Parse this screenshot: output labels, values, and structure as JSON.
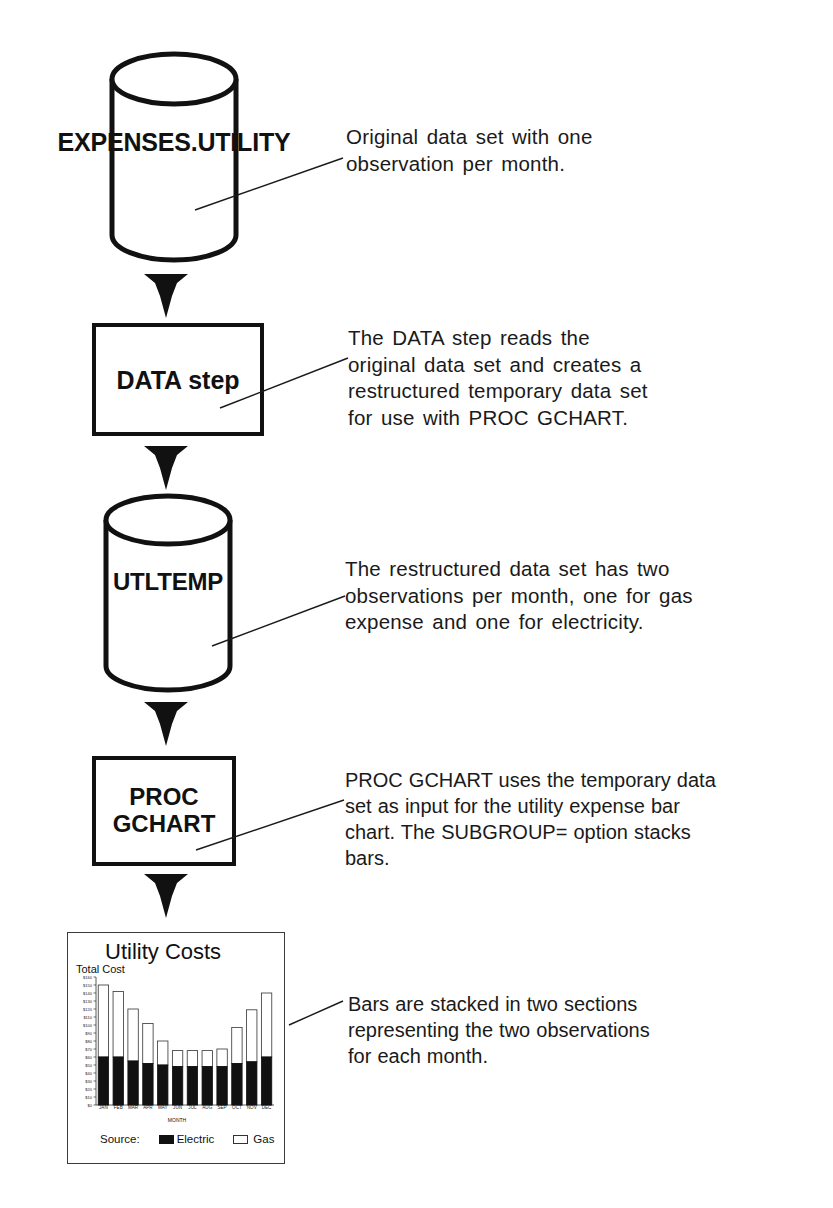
{
  "diagram": {
    "nodes": [
      {
        "id": "expenses-utility",
        "type": "dataset",
        "label": "EXPENSES.UTILITY"
      },
      {
        "id": "data-step",
        "type": "process",
        "label": "DATA step"
      },
      {
        "id": "utltemp",
        "type": "dataset",
        "label": "UTLTEMP"
      },
      {
        "id": "proc-gchart",
        "type": "process",
        "label": "PROC\nGCHART"
      },
      {
        "id": "output-chart",
        "type": "output",
        "label": "Utility Costs"
      }
    ],
    "annotations": [
      {
        "id": "annot-expenses",
        "text": "Original data set with one\nobservation per month."
      },
      {
        "id": "annot-data-step",
        "text": "The DATA step reads the\noriginal data set and creates a\nrestructured temporary data set\nfor use with PROC GCHART."
      },
      {
        "id": "annot-utltemp",
        "text": "The restructured data set has two\nobservations per month, one for gas\nexpense and one for electricity."
      },
      {
        "id": "annot-gchart",
        "text": "PROC GCHART uses the temporary data\nset as input for the utility expense bar\nchart. The SUBGROUP= option stacks\nbars."
      },
      {
        "id": "annot-output",
        "text": "Bars are stacked in two sections\nrepresenting the two observations\nfor each month."
      }
    ]
  },
  "chart_data": {
    "type": "bar",
    "subtype": "stacked-vertical",
    "title": "Utility Costs",
    "xlabel": "MONTH",
    "ylabel": "Total Cost",
    "categories": [
      "JAN",
      "FEB",
      "MAR",
      "APR",
      "MAY",
      "JUN",
      "JUL",
      "AUG",
      "SEP",
      "OCT",
      "NOV",
      "DEC"
    ],
    "series": [
      {
        "name": "Electric",
        "color": "#111111",
        "values": [
          60,
          60,
          55,
          52,
          50,
          48,
          48,
          48,
          48,
          52,
          54,
          60
        ]
      },
      {
        "name": "Gas",
        "color": "#ffffff",
        "values": [
          90,
          82,
          65,
          50,
          30,
          20,
          20,
          20,
          22,
          45,
          65,
          80
        ]
      }
    ],
    "totals": [
      150,
      142,
      120,
      102,
      80,
      68,
      68,
      68,
      70,
      97,
      119,
      140
    ],
    "ylim": [
      0,
      160
    ],
    "ytick_labels": [
      "$160",
      "$150",
      "$140",
      "$130",
      "$120",
      "$110",
      "$100",
      "$90",
      "$80",
      "$70",
      "$60",
      "$50",
      "$40",
      "$30",
      "$20",
      "$10",
      "$0"
    ],
    "grid": false,
    "legend": {
      "position": "bottom",
      "title": "Source:",
      "entries": [
        {
          "label": "Electric",
          "swatch": "filled-black"
        },
        {
          "label": "Gas",
          "swatch": "outline-white"
        }
      ]
    }
  }
}
